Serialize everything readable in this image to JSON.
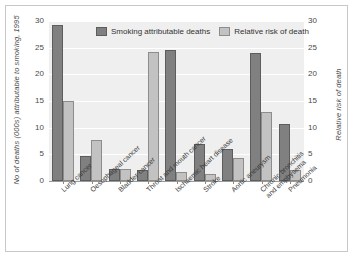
{
  "chart_data": {
    "type": "bar",
    "title": "",
    "categories": [
      "Lung cancer",
      "Oesophageal cancer",
      "Bladder cancer",
      "Throat and mouth cancer",
      "Ischaemic heart disease",
      "Stroke",
      "Aortic aneurysm",
      "Chronic bronchitis and emphysema",
      "Pneumonia"
    ],
    "category_lines": [
      [
        "Lung cancer"
      ],
      [
        "Oesophageal cancer"
      ],
      [
        "Bladder cancer"
      ],
      [
        "Throat and mouth cancer"
      ],
      [
        "Ischaemic heart disease"
      ],
      [
        "Stroke"
      ],
      [
        "Aortic aneurysm"
      ],
      [
        "Chronic bronchitis",
        "and emphysema"
      ],
      [
        "Pneumonia"
      ]
    ],
    "series": [
      {
        "name": "Smoking attributable deaths",
        "axis": "left",
        "color": "#808080",
        "values": [
          29.3,
          4.7,
          2.2,
          2.0,
          24.6,
          7.0,
          6.0,
          24.0,
          10.6
        ]
      },
      {
        "name": "Relative risk of death",
        "axis": "right",
        "color": "#c2c2c2",
        "values": [
          15.0,
          7.6,
          2.3,
          24.2,
          1.7,
          1.4,
          4.3,
          13.0,
          2.0
        ]
      }
    ],
    "xlabel": "",
    "ylabel": "No of deaths (000s) attributable to smoking, 1995",
    "ylabel_right": "Relative risk of death",
    "ylim": [
      0,
      30
    ],
    "ylim_right": [
      0,
      30
    ],
    "yticks": [
      0,
      5,
      10,
      15,
      20,
      25,
      30
    ],
    "yticks_right": [
      0,
      5,
      10,
      15,
      20,
      25,
      30
    ],
    "grid": true,
    "legend_position": "top-center",
    "plot_background": "#efefef",
    "gridline_color": "#ffffff"
  }
}
